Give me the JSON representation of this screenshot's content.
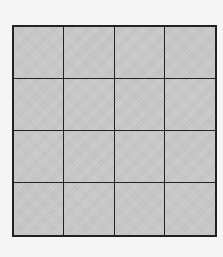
{
  "grid": {
    "rows": 4,
    "columns": 4,
    "fill_color": "#c9c9c9",
    "line_color": "#222222",
    "background_color": "#f5f5f5"
  }
}
